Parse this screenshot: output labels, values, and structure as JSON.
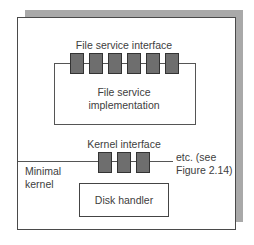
{
  "diagram": {
    "colors": {
      "shadow": "#a9a9a9",
      "frame_border": "#4a4a4a",
      "port_fill": "#6e6e6e",
      "text": "#404040"
    },
    "file_service": {
      "interface_label": "File service interface",
      "implementation_label_line1": "File service",
      "implementation_label_line2": "implementation",
      "port_count": 6
    },
    "kernel": {
      "interface_label": "Kernel interface",
      "side_label_line1": "Minimal",
      "side_label_line2": "kernel",
      "etc_label_line1": "etc. (see",
      "etc_label_line2": "Figure 2.14)",
      "port_count": 3
    },
    "disk_handler": {
      "label": "Disk handler"
    }
  }
}
